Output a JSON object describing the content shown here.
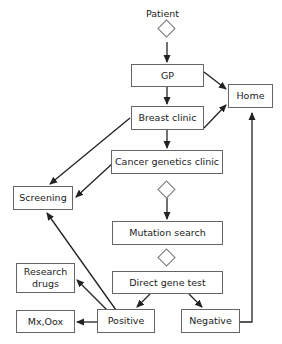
{
  "diagram": {
    "start_label": "Patient",
    "nodes": {
      "gp": "GP",
      "home": "Home",
      "breast_clinic": "Breast clinic",
      "cancer_genetics_clinic": "Cancer genetics clinic",
      "screening": "Screening",
      "mutation_search": "Mutation search",
      "direct_gene_test": "Direct gene test",
      "research_drugs": "Research drugs",
      "mx_oox": "Mx,Oox",
      "positive": "Positive",
      "negative": "Negative"
    },
    "edges": [
      {
        "from": "Patient",
        "to": "GP"
      },
      {
        "from": "GP",
        "to": "Home"
      },
      {
        "from": "GP",
        "to": "Breast clinic"
      },
      {
        "from": "Breast clinic",
        "to": "Home"
      },
      {
        "from": "Breast clinic",
        "to": "Screening"
      },
      {
        "from": "Breast clinic",
        "to": "Cancer genetics clinic"
      },
      {
        "from": "Cancer genetics clinic",
        "to": "Screening"
      },
      {
        "from": "Cancer genetics clinic",
        "to": "Mutation search"
      },
      {
        "from": "Mutation search",
        "to": "Direct gene test"
      },
      {
        "from": "Direct gene test",
        "to": "Positive"
      },
      {
        "from": "Direct gene test",
        "to": "Negative"
      },
      {
        "from": "Positive",
        "to": "Screening"
      },
      {
        "from": "Positive",
        "to": "Research drugs"
      },
      {
        "from": "Positive",
        "to": "Mx,Oox"
      },
      {
        "from": "Negative",
        "to": "Home"
      }
    ]
  }
}
